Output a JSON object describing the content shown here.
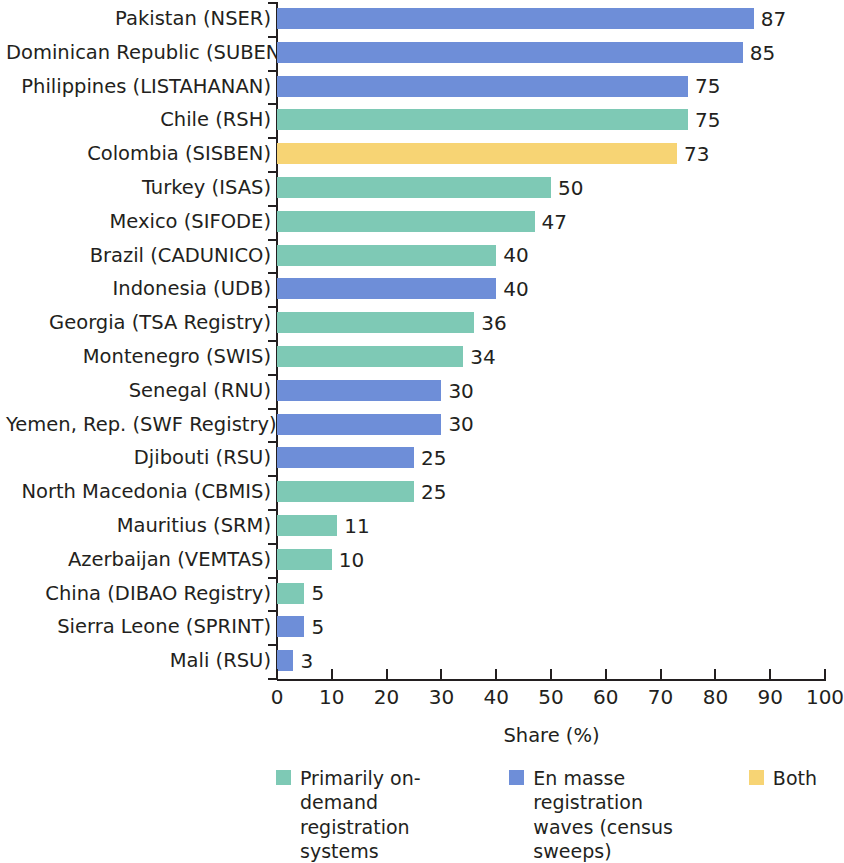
{
  "chart_data": {
    "type": "bar",
    "orientation": "horizontal",
    "title": "",
    "subtitle": "",
    "xlabel": "Share (%)",
    "ylabel": "",
    "xlim": [
      0,
      100
    ],
    "xticks": [
      0,
      10,
      20,
      30,
      40,
      50,
      60,
      70,
      80,
      90,
      100
    ],
    "xtick_labels": [
      "0",
      "10",
      "20",
      "30",
      "40",
      "50",
      "60",
      "70",
      "80",
      "90",
      "100"
    ],
    "grid": false,
    "legend_position": "bottom",
    "categories": [
      "Pakistan (NSER)",
      "Dominican Republic (SUBEN)",
      "Philippines (LISTAHANAN)",
      "Chile (RSH)",
      "Colombia (SISBEN)",
      "Turkey (ISAS)",
      "Mexico (SIFODE)",
      "Brazil (CADUNICO)",
      "Indonesia (UDB)",
      "Georgia (TSA Registry)",
      "Montenegro (SWIS)",
      "Senegal (RNU)",
      "Yemen, Rep. (SWF Registry)",
      "Djibouti (RSU)",
      "North Macedonia (CBMIS)",
      "Mauritius (SRM)",
      "Azerbaijan (VEMTAS)",
      "China (DIBAO Registry)",
      "Sierra Leone (SPRINT)",
      "Mali (RSU)"
    ],
    "values": [
      87,
      85,
      75,
      75,
      73,
      50,
      47,
      40,
      40,
      36,
      34,
      30,
      30,
      25,
      25,
      11,
      10,
      5,
      5,
      3
    ],
    "value_labels": [
      "87",
      "85",
      "75",
      "75",
      "73",
      "50",
      "47",
      "40",
      "40",
      "36",
      "34",
      "30",
      "30",
      "25",
      "25",
      "11",
      "10",
      "5",
      "5",
      "3"
    ],
    "group_keys": [
      "en_masse",
      "en_masse",
      "en_masse",
      "on_demand",
      "both",
      "on_demand",
      "on_demand",
      "on_demand",
      "en_masse",
      "on_demand",
      "on_demand",
      "en_masse",
      "en_masse",
      "en_masse",
      "on_demand",
      "on_demand",
      "on_demand",
      "on_demand",
      "en_masse",
      "en_masse"
    ],
    "series": [
      {
        "key": "on_demand",
        "name": "Primarily on-demand registration systems",
        "color": "#7ec9b5"
      },
      {
        "key": "en_masse",
        "name": "En masse registration waves (census sweeps)",
        "color": "#6e8ed8"
      },
      {
        "key": "both",
        "name": "Both",
        "color": "#f7d474"
      }
    ]
  },
  "legend": {
    "items": [
      {
        "label": "Primarily on-demand\nregistration systems",
        "color": "#7ec9b5",
        "key": "on_demand"
      },
      {
        "label": "En masse registration\nwaves (census sweeps)",
        "color": "#6e8ed8",
        "key": "en_masse"
      },
      {
        "label": "Both",
        "color": "#f7d474",
        "key": "both"
      }
    ]
  },
  "axis": {
    "x_title": "Share (%)"
  },
  "colors": {
    "on_demand": "#7ec9b5",
    "en_masse": "#6e8ed8",
    "both": "#f7d474",
    "axis": "#231f20",
    "text": "#231f20",
    "background": "#ffffff"
  }
}
